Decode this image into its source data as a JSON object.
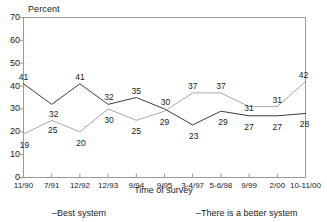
{
  "chart_data": {
    "type": "line",
    "title": "",
    "xlabel": "Time of survey",
    "ylabel": "Percent",
    "ylim": [
      0,
      70
    ],
    "ytick_values": [
      70,
      60,
      50,
      40,
      30,
      20,
      10,
      0
    ],
    "grid": false,
    "legend_position": "below-axis",
    "categories": [
      "11/90",
      "7/91",
      "12/92",
      "12/93",
      "9/94",
      "9/95",
      "3-4/97",
      "5-6/98",
      "9/99",
      "2/00",
      "10-11/00"
    ],
    "series": [
      {
        "name": "Best system",
        "color": "#3d3d3d",
        "values": [
          41,
          32,
          41,
          32,
          35,
          30,
          23,
          29,
          27,
          27,
          28
        ]
      },
      {
        "name": "There is a better system",
        "color": "#a8a8a8",
        "values": [
          19,
          25,
          20,
          30,
          25,
          29,
          37,
          37,
          31,
          31,
          42
        ]
      }
    ],
    "point_labels": {
      "best_system": [
        "41",
        "32",
        "41",
        "32",
        "35",
        "30",
        "23",
        "29",
        "27",
        "27",
        "28"
      ],
      "better_system": [
        "19",
        "25",
        "20",
        "30",
        "25",
        "29",
        "37",
        "37",
        "31",
        "31",
        "42"
      ]
    }
  },
  "legend": {
    "best_system": "–Best system",
    "better_system": "–There is a better system"
  },
  "axes": {
    "y_title": "Percent",
    "x_title": "Time of survey"
  },
  "colors": {
    "best_system_line": "#3d3d3d",
    "better_system_line": "#a8a8a8",
    "axis": "#9a9a9a",
    "text": "#1a1a1a",
    "background": "#ffffff"
  }
}
